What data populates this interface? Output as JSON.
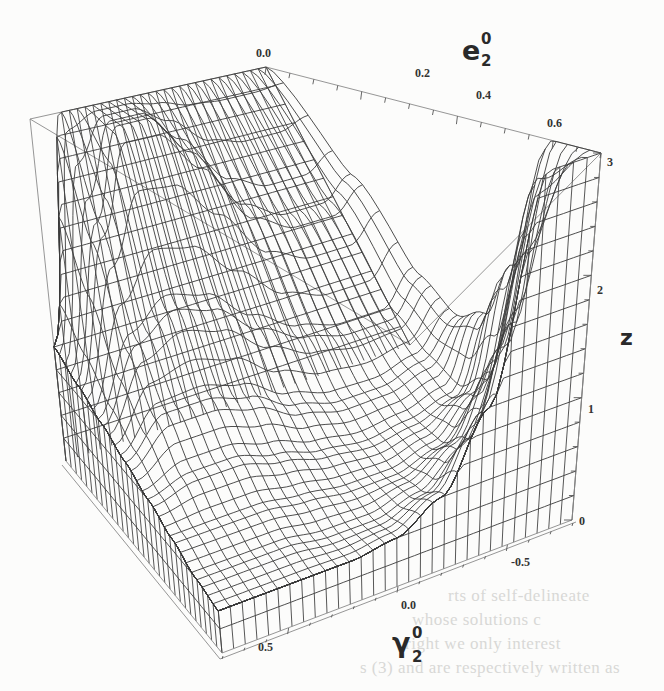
{
  "chart_data": {
    "type": "surface-3d-wireframe",
    "title": "",
    "axes": {
      "x": {
        "label": "e",
        "label_sub": "2",
        "label_sup": "0",
        "range": [
          0.0,
          0.7
        ],
        "ticks": [
          "0.0",
          "0.2",
          "0.4",
          "0.6"
        ],
        "tick_values": [
          0.0,
          0.2,
          0.4,
          0.6
        ]
      },
      "y": {
        "label": "γ",
        "label_sub": "2",
        "label_sup": "0",
        "range": [
          0.8,
          -0.8
        ],
        "ticks": [
          "0.5",
          "0.0",
          "-0.5"
        ],
        "tick_values": [
          0.5,
          0.0,
          -0.5
        ]
      },
      "z": {
        "label": "z",
        "range": [
          0,
          3
        ],
        "ticks": [
          "0",
          "1",
          "2",
          "3"
        ],
        "tick_values": [
          0,
          1,
          2,
          3
        ]
      }
    },
    "clip_z": 3,
    "grid": {
      "e_values": [
        0.0,
        0.1,
        0.2,
        0.3,
        0.4,
        0.5,
        0.6,
        0.7
      ],
      "gamma_values": [
        0.8,
        0.6,
        0.4,
        0.2,
        0.0,
        -0.2,
        -0.4,
        -0.6,
        -0.8
      ],
      "z": [
        [
          1.0,
          3.0,
          3.0,
          3.0,
          3.0,
          3.0,
          3.0,
          3.0,
          3.0
        ],
        [
          0.9,
          2.2,
          3.0,
          3.0,
          2.6,
          2.0,
          1.8,
          1.8,
          2.0
        ],
        [
          0.8,
          1.4,
          1.6,
          1.5,
          1.2,
          1.0,
          0.9,
          0.9,
          1.2
        ],
        [
          0.7,
          1.0,
          1.0,
          0.9,
          0.7,
          0.6,
          0.6,
          0.7,
          1.0
        ],
        [
          0.6,
          0.7,
          0.7,
          0.6,
          0.5,
          0.45,
          0.5,
          0.6,
          1.2
        ],
        [
          0.5,
          0.5,
          0.5,
          0.45,
          0.4,
          0.4,
          0.5,
          0.8,
          1.8
        ],
        [
          0.4,
          0.4,
          0.4,
          0.35,
          0.35,
          0.45,
          0.7,
          1.4,
          3.0
        ],
        [
          0.35,
          0.35,
          0.35,
          0.35,
          0.4,
          0.6,
          1.2,
          3.0,
          3.0
        ]
      ]
    },
    "mesh_lines_per_axis": 30,
    "boxed": true,
    "grid_lines": false,
    "legend": "none"
  },
  "bleed_through_text": [
    "rts of self-delineate",
    "whose     solutions     c",
    "right     we     only     interest",
    "s (3)     and     are     respectively     written     as"
  ]
}
